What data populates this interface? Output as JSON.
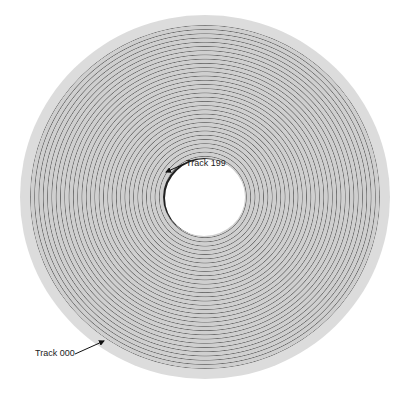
{
  "diagram": {
    "labels": {
      "inner_track": "Track 199",
      "outer_track": "Track 000"
    },
    "colors": {
      "disk": "#dcdcdc",
      "groove": "#6f6f6f",
      "hole": "#ffffff",
      "text": "#222222"
    }
  }
}
